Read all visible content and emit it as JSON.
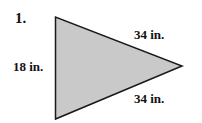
{
  "problem_number": "1.",
  "triangle": {
    "vertices": [
      [
        55.5,
        17
      ],
      [
        55.5,
        119
      ],
      [
        182,
        66
      ]
    ],
    "fill": "#c9c9c9",
    "stroke": "#1a1a1a",
    "sides": {
      "top": "34 in.",
      "left": "18 in.",
      "bottom": "34 in."
    }
  }
}
